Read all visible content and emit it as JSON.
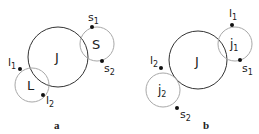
{
  "panels": [
    {
      "id": "a",
      "caption": "a",
      "main_circle": {
        "label": "J",
        "cx": 58,
        "cy": 57,
        "r": 30
      },
      "small_circles": [
        {
          "label": "S",
          "cx": 97,
          "cy": 44,
          "r": 17,
          "points": [
            {
              "name": "s",
              "sub": "1",
              "x": 92,
              "y": 27
            },
            {
              "name": "s",
              "sub": "2",
              "x": 102,
              "y": 61
            }
          ]
        },
        {
          "label": "L",
          "cx": 32,
          "cy": 85,
          "r": 17,
          "points": [
            {
              "name": "l",
              "sub": "1",
              "x": 20,
              "y": 69
            },
            {
              "name": "l",
              "sub": "2",
              "x": 43,
              "y": 95
            }
          ]
        }
      ]
    },
    {
      "id": "b",
      "caption": "b",
      "main_circle": {
        "label": "J",
        "cx": 198,
        "cy": 60,
        "r": 29
      },
      "small_circles": [
        {
          "label": "j",
          "label_sub": "1",
          "cx": 235,
          "cy": 44,
          "r": 17,
          "points": [
            {
              "name": "l",
              "sub": "1",
              "x": 232,
              "y": 25
            },
            {
              "name": "s",
              "sub": "1",
              "x": 240,
              "y": 60
            }
          ]
        },
        {
          "label": "j",
          "label_sub": "2",
          "cx": 163,
          "cy": 90,
          "r": 17,
          "points": [
            {
              "name": "l",
              "sub": "2",
              "x": 161,
              "y": 68
            },
            {
              "name": "s",
              "sub": "2",
              "x": 177,
              "y": 108
            }
          ]
        }
      ]
    }
  ],
  "colors": {
    "main_circle": "#333333",
    "small_circle": "#a8a8a8",
    "point": "#111111",
    "text": "#222222"
  }
}
